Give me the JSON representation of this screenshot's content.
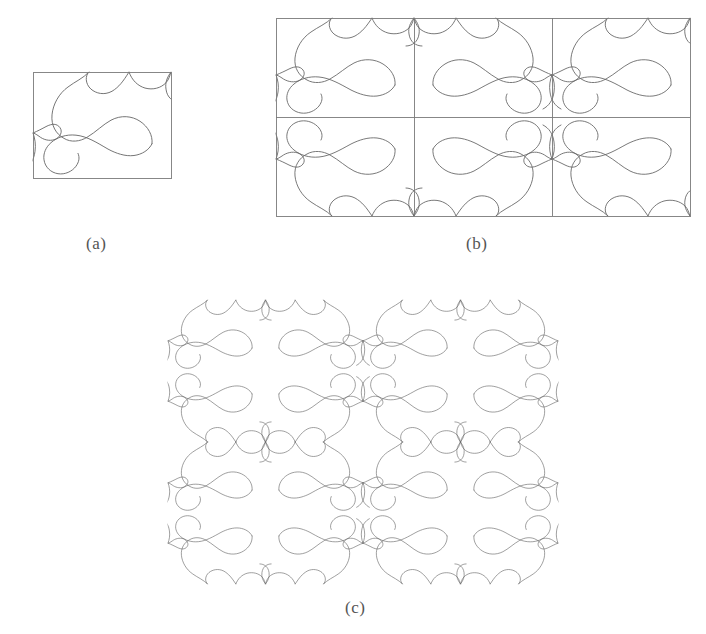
{
  "figure": {
    "kind": "line-drawing",
    "background_color": "#ffffff",
    "stroke_color": "#6a6a6a",
    "frame_color": "#7a7a7a",
    "stroke_width": 0.9,
    "frame_width": 0.9
  },
  "captions": {
    "a": "(a)",
    "b": "(b)",
    "c": "(c)"
  },
  "panels": {
    "a": {
      "label": "(a)",
      "role": "single-tile",
      "rect": {
        "x": 33,
        "y": 72,
        "w": 138,
        "h": 106
      },
      "cols": 1,
      "rows": 1,
      "show_borders": true,
      "show_outer_frame": true
    },
    "b": {
      "label": "(b)",
      "role": "reflected-block",
      "rect": {
        "x": 276,
        "y": 18,
        "w": 414,
        "h": 198
      },
      "cols": 3,
      "rows": 2,
      "show_borders": true,
      "show_outer_frame": true
    },
    "c": {
      "label": "(c)",
      "role": "seamless-tiling",
      "rect": {
        "x": 168,
        "y": 300,
        "w": 390,
        "h": 284
      },
      "cols": 4,
      "rows": 4,
      "show_borders": false,
      "show_outer_frame": false
    }
  },
  "tile": {
    "unit_width": 138,
    "unit_height": 99,
    "note": "Motif path expressed in a 138 x 99 unit box; tiling alternates mirrored copies in x and y.",
    "paths": [
      "M 96 0 C 90 9 86 14 79 18 C 71 22 63 20 58 16 C 52 11 52 3 56 0",
      "M 0 57 C 5 55 9 53 13 51 C 19 48 24 48 27 52 C 30 56 27 61 22 63 C 16 65 10 63 6 60 C 3 58 1 57 0 57",
      "M 138 0 C 134 5 132 10 133 16 C 134 24 140 28 146 28",
      "M 56 0 C 50 6 42 9 35 14 C 26 20 20 30 19 40 C 18 50 23 58 31 62 C 38 66 47 65 54 61 C 63 56 70 49 78 45 C 88 40 99 41 107 46 C 115 51 120 59 119 67",
      "M 96 0 C 99 8 105 13 112 15 C 120 17 128 15 133 10 C 136 7 137 3 138 0",
      "M 119 67 C 116 73 109 77 101 78 C 92 79 83 76 75 72 C 64 66 54 60 43 59 C 33 58 24 61 18 66 C 13 70 10 76 11 82 C 12 89 18 94 25 95 C 32 96 39 93 43 88 C 46 84 47 80 45 76",
      "M 0 57 C 2 62 3 68 2 74 C 1 82 -3 88 -9 91"
    ],
    "anchor_points": [
      {
        "name": "top-entry-left",
        "x": 56,
        "y": 0
      },
      {
        "name": "top-entry-right",
        "x": 96,
        "y": 0
      },
      {
        "name": "left-exit",
        "x": 0,
        "y": 57
      },
      {
        "name": "bottom-exit",
        "x": 45,
        "y": 99
      },
      {
        "name": "right-corner",
        "x": 138,
        "y": 0
      }
    ]
  }
}
